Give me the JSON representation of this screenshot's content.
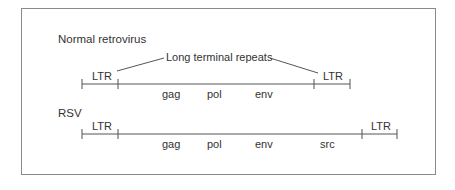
{
  "diagram": {
    "frame_color": "#8a8a8a",
    "line_color": "#555555",
    "rows": [
      {
        "title": "Normal retrovirus",
        "annotation": "Long terminal repeats",
        "left_ltr": "LTR",
        "right_ltr": "LTR",
        "genes": [
          "gag",
          "pol",
          "env"
        ]
      },
      {
        "title": "RSV",
        "left_ltr": "LTR",
        "right_ltr": "LTR",
        "genes": [
          "gag",
          "pol",
          "env",
          "src"
        ]
      }
    ]
  }
}
